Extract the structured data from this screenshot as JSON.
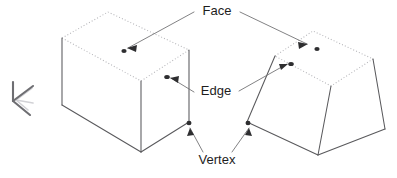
{
  "diagram": {
    "background_color": "#ffffff",
    "labels": {
      "face": "Face",
      "edge": "Edge",
      "vertex": "Vertex"
    },
    "label_color": "#1d1d1d",
    "solid_line_color": "#59595c",
    "hidden_line_color": "#b4b4b8",
    "leader_line_color": "#6b6b6e",
    "marker_color": "#2e2e30",
    "solids": [
      {
        "name": "box",
        "shape": "rectangular-box",
        "position": "left",
        "top_face_style": "dotted",
        "side_face_style": "solid"
      },
      {
        "name": "frustum",
        "shape": "truncated-pyramid",
        "position": "right",
        "top_face_style": "dotted",
        "side_face_style": "solid"
      }
    ],
    "annotations": [
      {
        "label": "Face",
        "targets": [
          "box-top-face",
          "frustum-top-face"
        ]
      },
      {
        "label": "Edge",
        "targets": [
          "box-top-front-edge",
          "frustum-top-left-edge"
        ]
      },
      {
        "label": "Vertex",
        "targets": [
          "box-front-right-vertex",
          "frustum-front-left-vertex"
        ]
      }
    ],
    "axis_triad": {
      "name": "orientation-axis-triad",
      "axes": [
        "z-up",
        "x-front",
        "y-right"
      ],
      "color": "#6e6e72",
      "ghost_color": "#d2d2d6"
    }
  }
}
